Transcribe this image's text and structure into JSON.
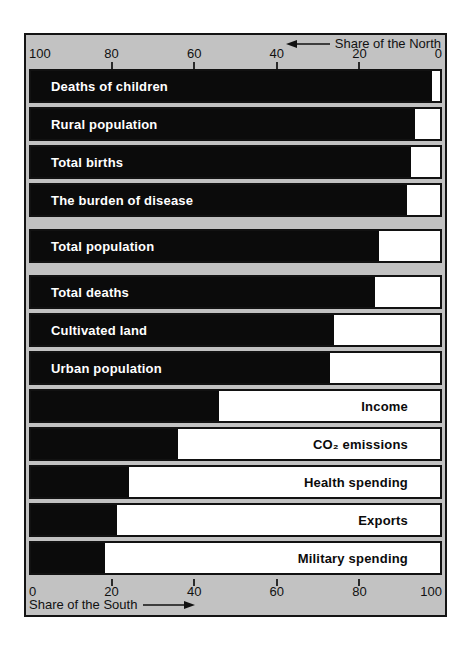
{
  "figure": {
    "plot_background": "#c2c2c2",
    "page_background": "#ffffff",
    "bar_fill_south": "#0b0b0b",
    "bar_fill_north": "#ffffff",
    "frame_color": "#141414"
  },
  "top_axis": {
    "title": "Share of the North",
    "arrow_direction": "left",
    "tick_labels": [
      "100",
      "80",
      "60",
      "40",
      "20",
      "0"
    ]
  },
  "bottom_axis": {
    "title": "Share of the South",
    "arrow_direction": "right",
    "tick_labels": [
      "0",
      "20",
      "40",
      "60",
      "80",
      "100"
    ]
  },
  "chart_data": {
    "type": "bar",
    "orientation": "horizontal",
    "stacked": true,
    "x_range": [
      0,
      100
    ],
    "grid": false,
    "legend": "none",
    "axes": {
      "top": {
        "label": "Share of the North",
        "min_at_right": true,
        "ticks": [
          100,
          80,
          60,
          40,
          20,
          0
        ]
      },
      "bottom": {
        "label": "Share of the South",
        "min_at_left": true,
        "ticks": [
          0,
          20,
          40,
          60,
          80,
          100
        ]
      }
    },
    "categories": [
      "Deaths of children",
      "Rural population",
      "Total births",
      "The burden of disease",
      "Total population",
      "Total deaths",
      "Cultivated land",
      "Urban population",
      "Income",
      "CO₂ emissions",
      "Health spending",
      "Exports",
      "Military spending"
    ],
    "series": [
      {
        "name": "Share of the South",
        "color": "#0b0b0b",
        "values": [
          98,
          94,
          93,
          92,
          85,
          84,
          74,
          73,
          46,
          36,
          24,
          21,
          18
        ]
      },
      {
        "name": "Share of the North",
        "color": "#ffffff",
        "values": [
          2,
          6,
          7,
          8,
          15,
          16,
          26,
          27,
          54,
          64,
          76,
          79,
          82
        ]
      }
    ],
    "rows": [
      {
        "label": "Deaths of children",
        "south": 98,
        "label_on": "black",
        "group_end": false
      },
      {
        "label": "Rural population",
        "south": 94,
        "label_on": "black",
        "group_end": false
      },
      {
        "label": "Total births",
        "south": 93,
        "label_on": "black",
        "group_end": false
      },
      {
        "label": "The burden of disease",
        "south": 92,
        "label_on": "black",
        "group_end": true
      },
      {
        "label": "Total population",
        "south": 85,
        "label_on": "black",
        "group_end": true
      },
      {
        "label": "Total deaths",
        "south": 84,
        "label_on": "black",
        "group_end": false
      },
      {
        "label": "Cultivated land",
        "south": 74,
        "label_on": "black",
        "group_end": false
      },
      {
        "label": "Urban population",
        "south": 73,
        "label_on": "black",
        "group_end": false
      },
      {
        "label": "Income",
        "south": 46,
        "label_on": "white",
        "group_end": false
      },
      {
        "label": "CO₂ emissions",
        "south": 36,
        "label_on": "white",
        "group_end": false
      },
      {
        "label": "Health spending",
        "south": 24,
        "label_on": "white",
        "group_end": false
      },
      {
        "label": "Exports",
        "south": 21,
        "label_on": "white",
        "group_end": false
      },
      {
        "label": "Military spending",
        "south": 18,
        "label_on": "white",
        "group_end": false
      }
    ]
  }
}
